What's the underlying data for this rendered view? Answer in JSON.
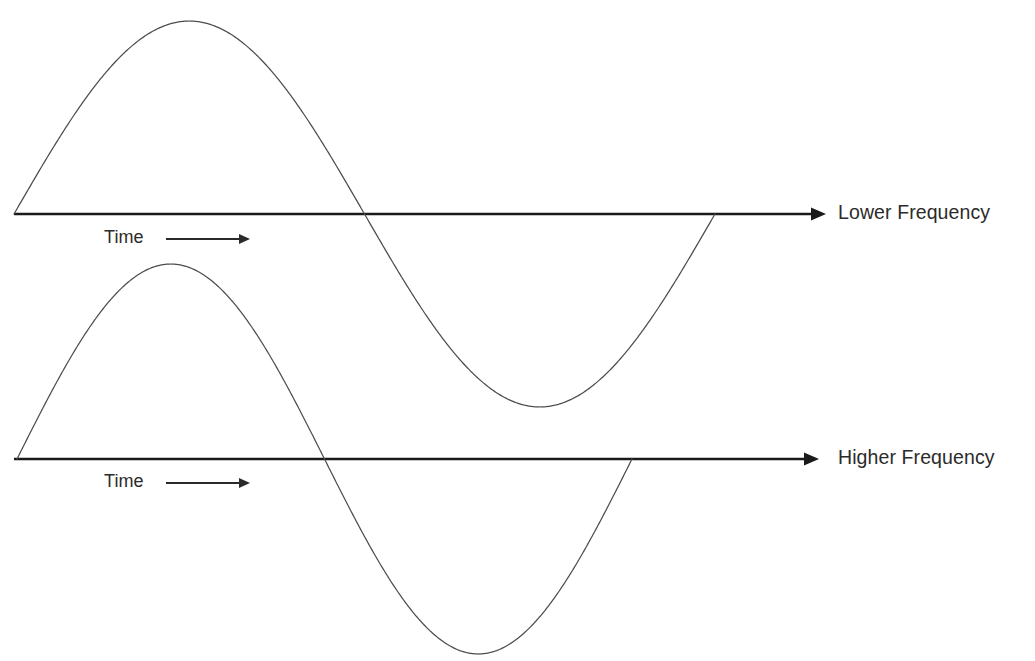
{
  "figure": {
    "background_color": "#ffffff",
    "axis_color": "#1a1a1a",
    "wave_color": "#4d4d4d",
    "text_color": "#2b2b2b"
  },
  "labels": {
    "lower_frequency": "Lower Frequency",
    "higher_frequency": "Higher Frequency",
    "time_upper": "Time",
    "time_lower": "Time"
  },
  "chart_data": {
    "type": "line",
    "title": "",
    "xlabel": "Time",
    "ylabel": "",
    "grid": false,
    "legend_position": "right",
    "annotations": [
      {
        "text": "Time",
        "target": "upper-axis",
        "x": 104,
        "y": 228,
        "arrow": "right"
      },
      {
        "text": "Time",
        "target": "lower-axis",
        "x": 104,
        "y": 472,
        "arrow": "right"
      },
      {
        "text": "Lower Frequency",
        "target": "upper-axis",
        "x": 838,
        "y": 214
      },
      {
        "text": "Higher Frequency",
        "target": "lower-axis",
        "x": 838,
        "y": 459
      }
    ],
    "series": [
      {
        "name": "Lower Frequency",
        "waveform": "sine",
        "cycles": 1,
        "amplitude_px": 193,
        "period_px": 701,
        "baseline_y_px": 214,
        "start_x_px": 14,
        "end_x_px": 715,
        "peak": {
          "x": 200,
          "y": 22
        },
        "zero_crossing": {
          "x": 365,
          "y": 214
        },
        "trough": {
          "x": 545,
          "y": 415
        },
        "axis_start_x_px": 14,
        "axis_end_x_px": 822
      },
      {
        "name": "Higher Frequency",
        "waveform": "sine",
        "cycles": 1,
        "amplitude_px": 195,
        "period_px": 615,
        "baseline_y_px": 459,
        "start_x_px": 17,
        "end_x_px": 632,
        "peak": {
          "x": 175,
          "y": 264
        },
        "zero_crossing": {
          "x": 322,
          "y": 459
        },
        "trough": {
          "x": 478,
          "y": 650
        },
        "axis_start_x_px": 14,
        "axis_end_x_px": 815
      }
    ],
    "xlim": [
      0,
      1035
    ],
    "ylim": [
      0,
      661
    ]
  }
}
